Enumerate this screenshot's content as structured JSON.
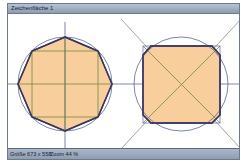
{
  "window": {
    "title": "Zeichenfläche 1"
  },
  "statusbar": {
    "size_label": "Größe 673 x 558",
    "zoom_label": "Zoom 44 %"
  },
  "canvas": {
    "fill_color": "#f8cf9c",
    "outline_color": "#3b3560",
    "guide_color_green": "#6f8a3c",
    "guide_color_blue": "#5a6799",
    "figures": [
      {
        "name": "octagon-in-circle",
        "center": [
          57,
          70
        ],
        "radius": 47
      },
      {
        "name": "truncated-square-in-circle",
        "center": [
          173,
          70
        ],
        "radius": 47
      }
    ]
  }
}
